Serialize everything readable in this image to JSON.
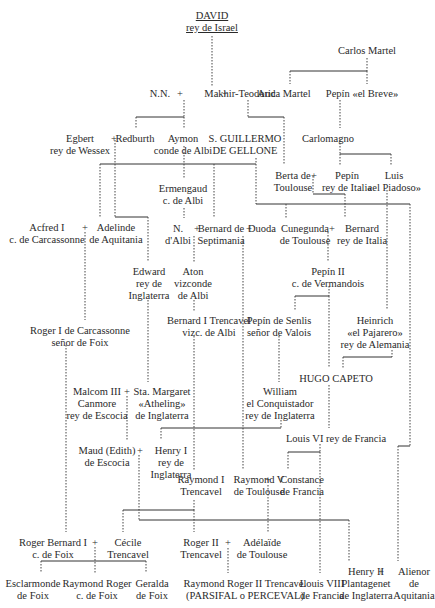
{
  "nodes": [
    {
      "id": "david",
      "lines": [
        "DAVID",
        "rey de Israel"
      ],
      "x": 212,
      "y": 10,
      "underline": true
    },
    {
      "id": "carlos_martel",
      "lines": [
        "Carlos Martel"
      ],
      "x": 367,
      "y": 45
    },
    {
      "id": "nn1",
      "lines": [
        "N.N."
      ],
      "x": 160,
      "y": 88
    },
    {
      "id": "makhir",
      "lines": [
        "Makhir-Teodoric"
      ],
      "x": 240,
      "y": 88
    },
    {
      "id": "auda",
      "lines": [
        "Auda Martel"
      ],
      "x": 284,
      "y": 88
    },
    {
      "id": "pepin_breve",
      "lines": [
        "Pepín «el Breve»"
      ],
      "x": 362,
      "y": 88
    },
    {
      "id": "egbert",
      "lines": [
        "Egbert",
        "rey de Wessex"
      ],
      "x": 80,
      "y": 133
    },
    {
      "id": "redburth",
      "lines": [
        "Redburth"
      ],
      "x": 135,
      "y": 133
    },
    {
      "id": "aymon",
      "lines": [
        "Aymon",
        "conde de Albi"
      ],
      "x": 183,
      "y": 133
    },
    {
      "id": "guillermo",
      "lines": [
        "S. GUILLERMO",
        "DE GELLONE"
      ],
      "x": 245,
      "y": 133
    },
    {
      "id": "carlomagno",
      "lines": [
        "Carlomagno"
      ],
      "x": 328,
      "y": 133
    },
    {
      "id": "ermengaud",
      "lines": [
        "Ermengaud",
        "c. de Albi"
      ],
      "x": 183,
      "y": 183
    },
    {
      "id": "berta",
      "lines": [
        "Berta de",
        "Toulouse"
      ],
      "x": 293,
      "y": 170
    },
    {
      "id": "pepin_italia",
      "lines": [
        "Pepín",
        "rey de Italia"
      ],
      "x": 347,
      "y": 170
    },
    {
      "id": "luis",
      "lines": [
        "Luis",
        "«el Piadoso»"
      ],
      "x": 394,
      "y": 170
    },
    {
      "id": "acfred",
      "lines": [
        "Acfred I",
        "c. de Carcassonne"
      ],
      "x": 47,
      "y": 222
    },
    {
      "id": "adelinde",
      "lines": [
        "Adelinde",
        "de Aquitania"
      ],
      "x": 116,
      "y": 222
    },
    {
      "id": "nn_albi",
      "lines": [
        "N.",
        "d'Albi"
      ],
      "x": 178,
      "y": 223
    },
    {
      "id": "bernard_sept",
      "lines": [
        "Bernard de",
        "Septimania"
      ],
      "x": 221,
      "y": 223
    },
    {
      "id": "duoda",
      "lines": [
        "Duoda"
      ],
      "x": 262,
      "y": 223
    },
    {
      "id": "cunegunda",
      "lines": [
        "Cunegunda",
        "de Toulouse"
      ],
      "x": 305,
      "y": 223
    },
    {
      "id": "bernard_italia",
      "lines": [
        "Bernard",
        "rey de Italia"
      ],
      "x": 362,
      "y": 223
    },
    {
      "id": "edward",
      "lines": [
        "Edward",
        "rey de",
        "Inglaterra"
      ],
      "x": 149,
      "y": 266
    },
    {
      "id": "aton",
      "lines": [
        "Aton",
        "vizconde",
        "de Albi"
      ],
      "x": 193,
      "y": 266
    },
    {
      "id": "pepin2",
      "lines": [
        "Pepín II",
        "c. de Vermandois"
      ],
      "x": 328,
      "y": 266
    },
    {
      "id": "bernard_trencavel",
      "lines": [
        "Bernard I Trencavel",
        "vizc. de Albi"
      ],
      "x": 209,
      "y": 315
    },
    {
      "id": "roger_carc",
      "lines": [
        "Roger I de Carcassonne",
        "señor de Foix"
      ],
      "x": 80,
      "y": 325
    },
    {
      "id": "pepin_senlis",
      "lines": [
        "Pepín de Senlis",
        "señor de Valois"
      ],
      "x": 279,
      "y": 315
    },
    {
      "id": "heinrich",
      "lines": [
        "Heinrich",
        "«el Pajarero»",
        "rey de Alemania"
      ],
      "x": 375,
      "y": 315
    },
    {
      "id": "hugo",
      "lines": [
        "HUGO CAPETO"
      ],
      "x": 336,
      "y": 373
    },
    {
      "id": "malcom",
      "lines": [
        "Malcom III",
        "Canmore",
        "rey de Escocia"
      ],
      "x": 97,
      "y": 386
    },
    {
      "id": "margaret",
      "lines": [
        "Sta. Margaret",
        "«Atheling»",
        "de Inglaterra"
      ],
      "x": 162,
      "y": 386
    },
    {
      "id": "william",
      "lines": [
        "William",
        "el Conquistador",
        "rey de Inglaterra"
      ],
      "x": 280,
      "y": 386
    },
    {
      "id": "louis6",
      "lines": [
        "Louis VI rey de Francia"
      ],
      "x": 336,
      "y": 433
    },
    {
      "id": "maud",
      "lines": [
        "Maud (Edith)",
        "de Escocia"
      ],
      "x": 107,
      "y": 445
    },
    {
      "id": "henry1",
      "lines": [
        "Henry I",
        "rey de",
        "Inglaterra"
      ],
      "x": 171,
      "y": 445
    },
    {
      "id": "raymond1",
      "lines": [
        "Raymond I",
        "Trencavel"
      ],
      "x": 201,
      "y": 474
    },
    {
      "id": "raymond5",
      "lines": [
        "Raymond V",
        "de Toulouse"
      ],
      "x": 259,
      "y": 474
    },
    {
      "id": "constance",
      "lines": [
        "Constance",
        "de Francia"
      ],
      "x": 302,
      "y": 474
    },
    {
      "id": "roger_bernard",
      "lines": [
        "Roger Bernard I",
        "c. de Foix"
      ],
      "x": 53,
      "y": 537
    },
    {
      "id": "cecile",
      "lines": [
        "Cécile",
        "Trencavel"
      ],
      "x": 128,
      "y": 537
    },
    {
      "id": "roger2",
      "lines": [
        "Roger II",
        "Trencavel"
      ],
      "x": 201,
      "y": 537
    },
    {
      "id": "adelaide",
      "lines": [
        "Adélaïde",
        "de Toulouse"
      ],
      "x": 262,
      "y": 537
    },
    {
      "id": "esclarmonde",
      "lines": [
        "Esclarmonde",
        "de Foix"
      ],
      "x": 33,
      "y": 578
    },
    {
      "id": "raymond_roger",
      "lines": [
        "Raymond Roger",
        "c. de Foix"
      ],
      "x": 97,
      "y": 578
    },
    {
      "id": "geralda",
      "lines": [
        "Geralda",
        "de Foix"
      ],
      "x": 152,
      "y": 578
    },
    {
      "id": "raymond_roger2",
      "lines": [
        "Raymond Roger II Trencavel",
        "(PARSIFAL o PERCEVAL)"
      ],
      "x": 245,
      "y": 578
    },
    {
      "id": "louis8",
      "lines": [
        "Louis VIII",
        "de Francia"
      ],
      "x": 322,
      "y": 578
    },
    {
      "id": "henry2",
      "lines": [
        "Henry II",
        "Plantagenet",
        "de Inglaterra"
      ],
      "x": 366,
      "y": 566
    },
    {
      "id": "alienor",
      "lines": [
        "Alienor",
        "de",
        "Aquitania"
      ],
      "x": 414,
      "y": 566
    }
  ],
  "marriage_symbol": "+",
  "marriages": [
    {
      "x": 180,
      "y": 88
    },
    {
      "x": 225,
      "y": 88
    },
    {
      "x": 114,
      "y": 133
    },
    {
      "x": 314,
      "y": 170
    },
    {
      "x": 85,
      "y": 222
    },
    {
      "x": 197,
      "y": 223
    },
    {
      "x": 249,
      "y": 223
    },
    {
      "x": 332,
      "y": 223
    },
    {
      "x": 127,
      "y": 386
    },
    {
      "x": 140,
      "y": 445
    },
    {
      "x": 268,
      "y": 474
    },
    {
      "x": 95,
      "y": 537
    },
    {
      "x": 228,
      "y": 537
    },
    {
      "x": 381,
      "y": 566
    }
  ]
}
